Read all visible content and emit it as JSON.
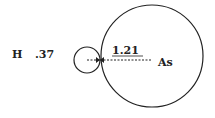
{
  "diagram": {
    "h_label": "H",
    "h_radius": ".37",
    "bond_label": "1.21",
    "as_label": "As",
    "colors": {
      "stroke": "#222222",
      "background": "#ffffff"
    }
  }
}
